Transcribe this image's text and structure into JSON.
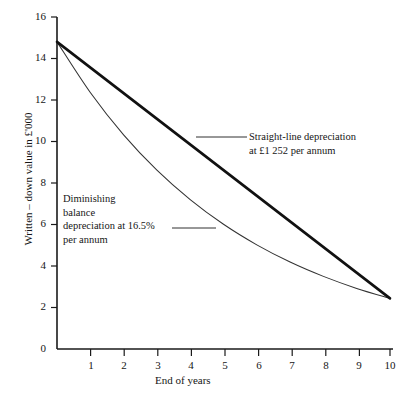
{
  "chart_data": {
    "type": "line",
    "title": "",
    "xlabel": "End of years",
    "ylabel": "Written – down value in £'000",
    "xlim": [
      0,
      10
    ],
    "ylim": [
      0,
      16
    ],
    "grid": false,
    "legend_position": "inline-annotations",
    "xticks": [
      "1",
      "2",
      "3",
      "4",
      "5",
      "6",
      "7",
      "8",
      "9",
      "10"
    ],
    "xtick_values": [
      1,
      2,
      3,
      4,
      5,
      6,
      7,
      8,
      9,
      10
    ],
    "yticks": [
      "0",
      "2",
      "4",
      "6",
      "8",
      "10",
      "12",
      "14",
      "16"
    ],
    "ytick_values": [
      0,
      2,
      4,
      6,
      8,
      10,
      12,
      14,
      16
    ],
    "x": [
      0,
      1,
      2,
      3,
      4,
      5,
      6,
      7,
      8,
      9,
      10
    ],
    "series": [
      {
        "name": "Straight-line depreciation",
        "style": "thick-straight",
        "values": [
          14.8,
          13.55,
          12.3,
          11.05,
          9.8,
          8.54,
          7.29,
          6.04,
          4.79,
          3.54,
          2.44
        ]
      },
      {
        "name": "Diminishing balance depreciation",
        "style": "thin-curve",
        "values": [
          14.8,
          12.36,
          10.32,
          8.62,
          7.2,
          6.01,
          5.02,
          4.19,
          3.5,
          2.92,
          2.44
        ]
      }
    ],
    "annotations": [
      {
        "id": "straight-line",
        "lines": [
          "Straight-line depreciation",
          "at £1 252 per annum"
        ],
        "leader": true
      },
      {
        "id": "diminishing-balance",
        "lines": [
          "Diminishing",
          "balance",
          "depreciation at 16.5%",
          "per annum"
        ],
        "leader": true
      }
    ]
  },
  "axis": {
    "x_title": "End of years",
    "y_title": "Written – down value in £'000"
  },
  "annotations": {
    "straight": {
      "line1": "Straight-line depreciation",
      "line2": "at £1 252 per annum"
    },
    "diminishing": {
      "line1": "Diminishing",
      "line2": "balance",
      "line3": "depreciation at 16.5%",
      "line4": "per annum"
    }
  },
  "colors": {
    "axis": "#1a1a1a",
    "straight_line": "#111111",
    "diminishing_line": "#333333",
    "background": "#ffffff"
  }
}
